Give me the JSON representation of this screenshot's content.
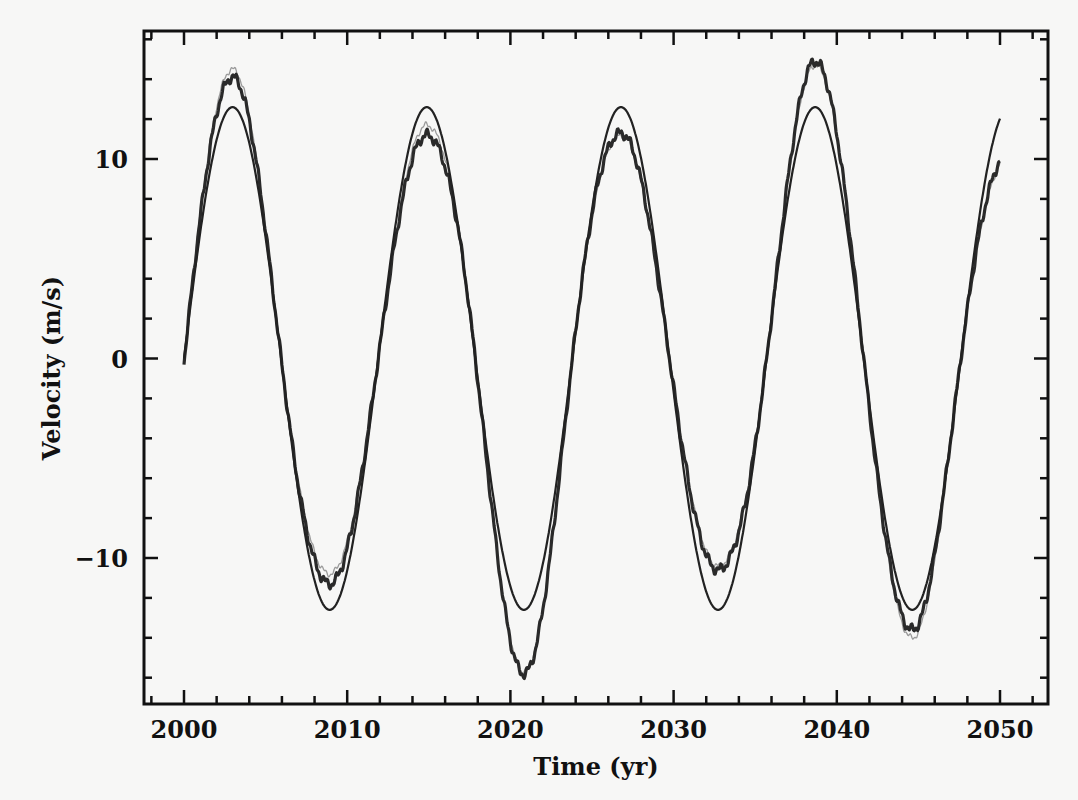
{
  "chart_data": {
    "type": "line",
    "title": "",
    "xlabel": "Time (yr)",
    "ylabel": "Velocity (m/s)",
    "xlim": [
      1997.5,
      2053
    ],
    "ylim": [
      -17.3,
      16.4
    ],
    "grid": false,
    "legend": null,
    "x_ticks": [
      2000,
      2010,
      2020,
      2030,
      2040,
      2050
    ],
    "x_tick_labels": [
      "2000",
      "2010",
      "2020",
      "2030",
      "2040",
      "2050"
    ],
    "x_minor_step": 2,
    "y_ticks": [
      -10,
      0,
      10
    ],
    "y_tick_labels": [
      "−10",
      "0",
      "10"
    ],
    "y_minor_step": 2,
    "x": [
      2000,
      2001,
      2002,
      2003,
      2004,
      2005,
      2006,
      2007,
      2008,
      2009,
      2010,
      2011,
      2012,
      2013,
      2014,
      2015,
      2016,
      2017,
      2018,
      2019,
      2020,
      2021,
      2022,
      2023,
      2024,
      2025,
      2026,
      2027,
      2028,
      2029,
      2030,
      2031,
      2032,
      2033,
      2034,
      2035,
      2036,
      2037,
      2038,
      2039,
      2040,
      2041,
      2042,
      2043,
      2044,
      2045,
      2046,
      2047,
      2048,
      2049,
      2050
    ],
    "series": [
      {
        "name": "model sinusoid (smooth)",
        "color": "#222222",
        "width": 2.2,
        "values": [
          0,
          6.35,
          10.97,
          12.6,
          10.8,
          6.04,
          -0.33,
          -6.65,
          -11.12,
          -12.59,
          -10.63,
          -5.72,
          0.67,
          6.95,
          11.27,
          12.57,
          10.46,
          5.4,
          -1.0,
          -7.25,
          -11.42,
          -12.54,
          -10.27,
          -5.08,
          1.33,
          7.53,
          11.56,
          12.5,
          10.08,
          4.75,
          -1.66,
          -7.82,
          -11.69,
          -12.44,
          -9.88,
          -4.42,
          1.99,
          8.1,
          11.82,
          12.38,
          9.67,
          4.09,
          -2.31,
          -8.37,
          -11.94,
          -12.3,
          -9.46,
          -3.75,
          2.64,
          8.64,
          12.05
        ]
      },
      {
        "name": "measured velocity (thick)",
        "color": "#2a2a2a",
        "width": 3.2,
        "values": [
          -0.2,
          7.1,
          12.27,
          14.1,
          11.68,
          6.3,
          -0.33,
          -6.45,
          -10.37,
          -11.29,
          -9.52,
          -5.12,
          0.59,
          6.19,
          10.03,
          11.26,
          9.92,
          5.5,
          -1.09,
          -8.38,
          -14.0,
          -15.59,
          -12.15,
          -5.71,
          1.41,
          7.56,
          10.91,
          11.18,
          8.93,
          4.17,
          -1.44,
          -6.7,
          -9.92,
          -10.66,
          -9.01,
          -4.28,
          2.03,
          8.71,
          13.36,
          14.57,
          11.23,
          4.67,
          -2.6,
          -9.27,
          -13.02,
          -13.1,
          -9.69,
          -3.66,
          2.44,
          7.56,
          9.94
        ]
      },
      {
        "name": "measured velocity (light)",
        "color": "#9a9a9a",
        "width": 1.3,
        "values": [
          -0.2,
          7.3,
          12.62,
          14.5,
          11.88,
          6.34,
          -0.33,
          -6.33,
          -10.05,
          -10.8,
          -9.26,
          -5.05,
          0.6,
          6.31,
          10.37,
          11.75,
          10.31,
          5.64,
          -1.09,
          -8.33,
          -13.83,
          -15.5,
          -12.08,
          -5.67,
          1.4,
          7.51,
          10.83,
          11.08,
          8.84,
          4.12,
          -1.42,
          -6.62,
          -9.78,
          -10.47,
          -8.88,
          -4.24,
          2.02,
          8.7,
          13.38,
          14.41,
          11.21,
          4.71,
          -2.66,
          -9.56,
          -13.38,
          -13.42,
          -9.85,
          -3.7,
          2.46,
          7.56,
          9.87
        ]
      }
    ],
    "model": {
      "period_yr": 11.9,
      "amplitude": 12.6,
      "t0": 2000,
      "observed_extremes": {
        "t": [
          2002.975,
          2008.925,
          2014.875,
          2020.825,
          2026.775,
          2032.725,
          2038.675,
          2044.625,
          2050.575
        ],
        "thick_amplitude": [
          14.1,
          11.3,
          11.2,
          15.8,
          11.3,
          10.6,
          14.9,
          13.6,
          10.3
        ],
        "light_amplitude": [
          14.5,
          10.8,
          11.7,
          15.7,
          11.2,
          10.4,
          14.7,
          14.0,
          10.1
        ]
      }
    }
  }
}
